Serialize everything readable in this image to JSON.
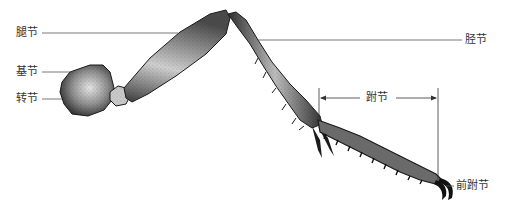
{
  "diagram": {
    "colors": {
      "ink": "#1a1a1a",
      "leader_line": "#555555",
      "label_text": "#333333",
      "segment_fill_dark": "#3a3a3a",
      "segment_fill_mid": "#8a8a8a",
      "segment_fill_light": "#d8d8d8"
    },
    "labels": [
      {
        "id": "femur",
        "text": "腿节",
        "side": "left",
        "x": 16,
        "y": 27
      },
      {
        "id": "coxa",
        "text": "基节",
        "side": "left",
        "x": 16,
        "y": 66
      },
      {
        "id": "trochanter",
        "text": "转节",
        "side": "left",
        "x": 16,
        "y": 94
      },
      {
        "id": "tibia",
        "text": "胫节",
        "side": "right",
        "x": 466,
        "y": 35
      },
      {
        "id": "tarsus",
        "text": "跗节",
        "side": "dimension",
        "x": 366,
        "y": 91
      },
      {
        "id": "pretarsus",
        "text": "前跗节",
        "side": "right",
        "x": 456,
        "y": 180
      }
    ]
  }
}
